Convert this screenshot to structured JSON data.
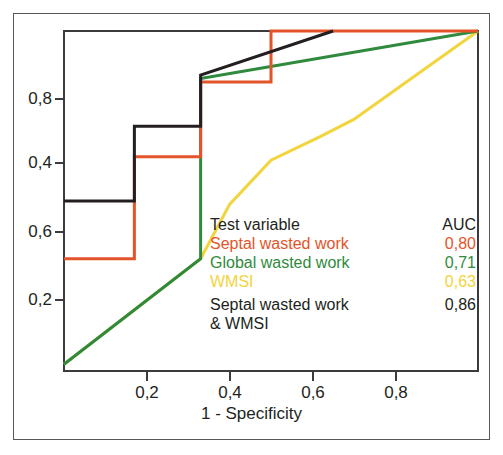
{
  "chart_data": {
    "type": "line",
    "title": "",
    "subtitle": "",
    "xlabel": "1 - Specificity",
    "ylabel": "",
    "xlim": [
      0,
      1
    ],
    "ylim": [
      0,
      1
    ],
    "grid": false,
    "legend_position": "inside-center-right",
    "x_ticks": [
      "0,2",
      "0,4",
      "0,6",
      "0,8"
    ],
    "x_tick_values": [
      0.2,
      0.4,
      0.6,
      0.8
    ],
    "y_ticks": [
      "0,8",
      "0,4",
      "0,6",
      "0,2"
    ],
    "y_tick_positions": [
      0.8,
      0.62,
      0.42,
      0.21
    ],
    "series": [
      {
        "name": "Septal wasted work",
        "auc": "0,80",
        "auc_value": 0.8,
        "color": "#e4542a",
        "points": [
          [
            0.0,
            0.33
          ],
          [
            0.17,
            0.33
          ],
          [
            0.17,
            0.63
          ],
          [
            0.33,
            0.63
          ],
          [
            0.33,
            0.85
          ],
          [
            0.5,
            0.85
          ],
          [
            0.5,
            1.0
          ],
          [
            1.0,
            1.0
          ]
        ]
      },
      {
        "name": "Global wasted work",
        "auc": "0,71",
        "auc_value": 0.71,
        "color": "#2f8a3e",
        "points": [
          [
            0.0,
            0.02
          ],
          [
            0.33,
            0.33
          ],
          [
            0.33,
            0.86
          ],
          [
            1.0,
            1.0
          ]
        ]
      },
      {
        "name": "WMSI",
        "auc": "0,63",
        "auc_value": 0.63,
        "color": "#f2d43c",
        "points": [
          [
            0.0,
            0.02
          ],
          [
            0.33,
            0.33
          ],
          [
            0.4,
            0.49
          ],
          [
            0.5,
            0.62
          ],
          [
            0.62,
            0.69
          ],
          [
            0.7,
            0.74
          ],
          [
            1.0,
            1.0
          ]
        ]
      },
      {
        "name": "Septal wasted work & WMSI",
        "auc": "0,86",
        "auc_value": 0.86,
        "color": "#231f20",
        "points": [
          [
            0.0,
            0.5
          ],
          [
            0.17,
            0.5
          ],
          [
            0.17,
            0.72
          ],
          [
            0.33,
            0.72
          ],
          [
            0.33,
            0.87
          ],
          [
            0.65,
            1.0
          ]
        ]
      }
    ]
  },
  "legend": {
    "header_name": "Test variable",
    "header_auc": "AUC",
    "header_color": "#231f20",
    "rows": [
      {
        "name": "Septal wasted work",
        "auc": "0,80",
        "color": "#e4542a"
      },
      {
        "name": "Global wasted work",
        "auc": "0,71",
        "color": "#2f8a3e"
      },
      {
        "name": "WMSI",
        "auc": "0,63",
        "color": "#f2d43c"
      },
      {
        "name": "Septal wasted work",
        "auc": "0,86",
        "color": "#231f20"
      }
    ],
    "continuation": "& WMSI"
  },
  "axis": {
    "x_title": "1 - Specificity",
    "x_tick_labels": [
      "0,2",
      "0,4",
      "0,6",
      "0,8"
    ],
    "y_tick_labels": [
      "0,8",
      "0,4",
      "0,6",
      "0,2"
    ]
  },
  "colors": {
    "septal": "#e4542a",
    "global": "#2f8a3e",
    "wmsi": "#f2d43c",
    "combined": "#231f20",
    "axis": "#3b3b3d",
    "border": "#58585a",
    "background": "#ffffff"
  }
}
